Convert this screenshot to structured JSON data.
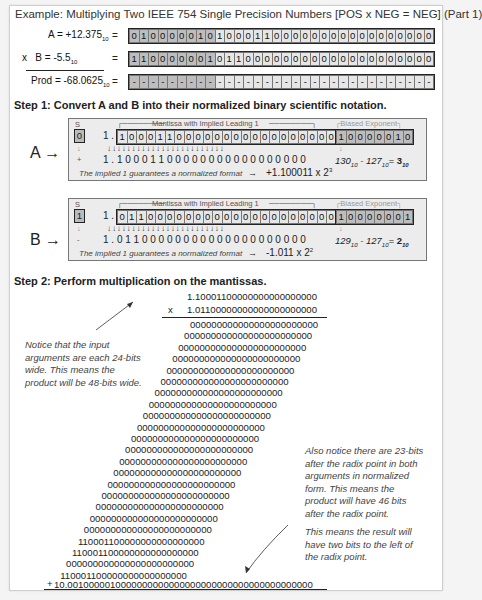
{
  "title": "Example: Multiplying Two IEEE 754 Single Precision Numbers [POS x NEG = NEG] (Part 1)",
  "inputs": {
    "a_label": "A = +12.375",
    "a_sub": "10",
    "a_eq": "=",
    "a_bits": "01000001010001100000000000000000",
    "b_prefix": "x",
    "b_label": "B = -5.5",
    "b_sub": "10",
    "b_eq": "=",
    "b_bits": "11000000101100000000000000000000",
    "prod_label": "Prod = -68.0625",
    "prod_sub": "10",
    "prod_eq": "=",
    "prod_bits": "--------------------------------"
  },
  "step1": {
    "heading": "Step 1: Convert A and B into their normalized binary scientific notation.",
    "sign_label": "S",
    "mantissa_label": "Mantissa with Implied Leading 1",
    "exponent_label": "Biased Exponent",
    "implied_prefix": "1 .",
    "arrow_row": "↓↓↓↓↓↓↓↓↓↓↓↓↓↓↓↓↓↓↓↓↓↓↓↓",
    "implied_note": "The implied 1 guarantees a normalized format",
    "a": {
      "letter": "A →",
      "sign_bit": "0",
      "sign_symbol": "+",
      "mantissa_bits": "10001100000000000000000",
      "exponent_bits": "10000010",
      "normalized": "1 . 1 0 0 0 1 1 0 0 0 0 0 0 0 0 0 0 0 0 0 0 0 0 0",
      "exp_calc_1": "130",
      "exp_calc_2": "127",
      "exp_result": "3",
      "result": "+1.100011 x 2",
      "result_exp": "3"
    },
    "b": {
      "letter": "B →",
      "sign_bit": "1",
      "sign_symbol": "-",
      "mantissa_bits": "01100000000000000000000",
      "exponent_bits": "10000001",
      "normalized": "1 . 0 1 1 0 0 0 0 0 0 0 0 0 0 0 0 0 0 0 0 0 0 0 0",
      "exp_calc_1": "129",
      "exp_calc_2": "127",
      "exp_result": "2",
      "result": "-1.011 x 2",
      "result_exp": "2"
    }
  },
  "step2": {
    "heading": "Step 2: Perform multiplication on the mantissas.",
    "multiplicand": "1.10001100000000000000000",
    "multiplier_op": "x",
    "multiplier": "1.01100000000000000000000",
    "partials": [
      "000000000000000000000000",
      "000000000000000000000000",
      "000000000000000000000000",
      "000000000000000000000000",
      "000000000000000000000000",
      "000000000000000000000000",
      "000000000000000000000000",
      "000000000000000000000000",
      "000000000000000000000000",
      "000000000000000000000000",
      "000000000000000000000000",
      "000000000000000000000000",
      "000000000000000000000000",
      "000000000000000000000000",
      "000000000000000000000000",
      "000000000000000000000000",
      "000000000000000000000000",
      "000000000000000000000000",
      "000000000000000000000000",
      "110001100000000000000000",
      "110001100000000000000000",
      "000000000000000000000000",
      "110001100000000000000000"
    ],
    "plus": "+",
    "product": "10.0010000010000000000000000000000000000000000000",
    "note_left": [
      "Notice that the input",
      "arguments are each 24-bits",
      "wide.  This means the",
      "product will be 48-bits wide."
    ],
    "note_right_1": [
      "Also notice there are 23-bits",
      "after the radix point in both",
      "arguments in normalized",
      "form.  This means the",
      "product will have 46 bits",
      "after the radix point."
    ],
    "note_right_2": [
      "This means the result will",
      "have two bits to the left of",
      "the radix point."
    ]
  }
}
